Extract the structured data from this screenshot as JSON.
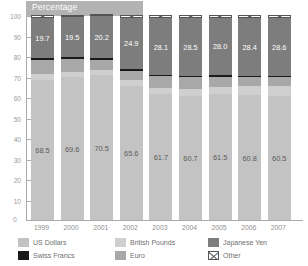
{
  "chart_data": {
    "type": "bar",
    "subtype": "stacked-bar-100pct",
    "title": "Percentage",
    "xlabel": "",
    "ylabel": "",
    "ylim": [
      0,
      100
    ],
    "ytick_step": 10,
    "yticks": [
      "0",
      "10",
      "20",
      "30",
      "40",
      "50",
      "60",
      "70",
      "80",
      "90",
      "100"
    ],
    "grid": false,
    "legend_position": "bottom",
    "categories": [
      "1999",
      "2000",
      "2001",
      "2002",
      "2003",
      "2004",
      "2005",
      "2006",
      "2007"
    ],
    "series": [
      {
        "name": "US Dollars",
        "color": "#c3c3c3",
        "values": [
          68.5,
          69.6,
          70.5,
          65.6,
          61.7,
          60.7,
          61.5,
          60.8,
          60.5
        ],
        "labels": [
          "68.5",
          "69.6",
          "70.5",
          "65.6",
          "61.7",
          "60.7",
          "61.5",
          "60.8",
          "60.5"
        ],
        "labels_shown": true
      },
      {
        "name": "British Pounds",
        "color": "#cfcfcf",
        "values": [
          2.9,
          2.8,
          2.7,
          2.8,
          2.8,
          3.3,
          3.4,
          4.4,
          4.7
        ],
        "labels_shown": false
      },
      {
        "name": "Euro",
        "color": "#a8a8a8",
        "values": [
          6.5,
          6.0,
          5.1,
          4.4,
          5.8,
          6.0,
          4.9,
          4.8,
          4.6
        ],
        "labels_shown": false
      },
      {
        "name": "Swiss Francs",
        "color": "#1a1a1a",
        "values": [
          1.0,
          0.9,
          0.9,
          1.0,
          0.3,
          0.3,
          0.9,
          0.3,
          0.3
        ],
        "labels_shown": false
      },
      {
        "name": "Japanese Yen",
        "color": "#7d7d7d",
        "values": [
          19.7,
          19.5,
          20.2,
          24.9,
          28.1,
          28.5,
          28.0,
          28.4,
          28.6
        ],
        "labels": [
          "19.7",
          "19.5",
          "20.2",
          "24.9",
          "28.1",
          "28.5",
          "28.0",
          "28.4",
          "28.6"
        ],
        "labels_shown": true
      },
      {
        "name": "Other",
        "color": "#ffffff",
        "pattern": "cross-hatch",
        "values": [
          1.4,
          1.2,
          0.6,
          1.3,
          1.3,
          1.2,
          1.3,
          1.3,
          1.3
        ],
        "labels_shown": false
      }
    ]
  },
  "legend": {
    "items": [
      {
        "label": "US Dollars",
        "swatch": "usd-swatch"
      },
      {
        "label": "British Pounds",
        "swatch": "gbp-swatch"
      },
      {
        "label": "Japanese Yen",
        "swatch": "jpy-swatch"
      },
      {
        "label": "Swiss Francs",
        "swatch": "chf-swatch"
      },
      {
        "label": "Euro",
        "swatch": "eur-swatch"
      },
      {
        "label": "Other",
        "swatch": "other-swatch"
      }
    ]
  },
  "axis": {
    "zero_label": "0"
  }
}
